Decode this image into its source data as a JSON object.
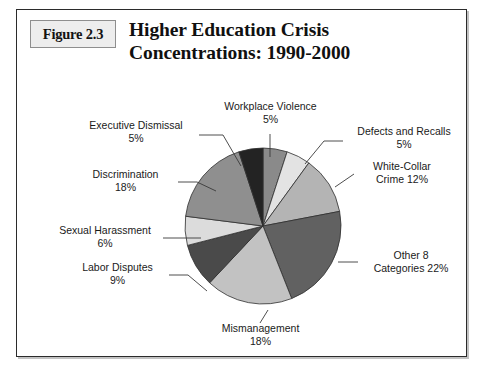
{
  "figure": {
    "label": "Figure 2.3",
    "title_line1": "Higher Education Crisis",
    "title_line2": "Concentrations: 1990-2000"
  },
  "chart_data": {
    "type": "pie",
    "title": "Higher Education Crisis Concentrations: 1990-2000",
    "xlabel": "",
    "ylabel": "",
    "units": "percent",
    "total": 100,
    "legend": "none",
    "grid": false,
    "start_angle_deg": 0,
    "direction": "clockwise",
    "categories": [
      "Workplace Violence",
      "Defects and Recalls",
      "White-Collar Crime",
      "Other 8 Categories",
      "Mismanagement",
      "Labor Disputes",
      "Sexual Harassment",
      "Discrimination",
      "Executive Dismissal"
    ],
    "values": [
      5,
      5,
      12,
      22,
      18,
      9,
      6,
      18,
      5
    ],
    "colors": [
      "#8a8a8a",
      "#e3e3e3",
      "#b4b4b4",
      "#616161",
      "#c2c2c2",
      "#4a4a4a",
      "#dcdcdc",
      "#8f8f8f",
      "#232323"
    ],
    "slices": [
      {
        "name": "Workplace Violence",
        "value": 5,
        "label_line1": "Workplace Violence",
        "label_line2": "5%"
      },
      {
        "name": "Defects and Recalls",
        "value": 5,
        "label_line1": "Defects and Recalls",
        "label_line2": "5%"
      },
      {
        "name": "White-Collar Crime",
        "value": 12,
        "label_line1": "White-Collar",
        "label_line2": "Crime 12%"
      },
      {
        "name": "Other 8 Categories",
        "value": 22,
        "label_line1": "Other 8",
        "label_line2": "Categories 22%"
      },
      {
        "name": "Mismanagement",
        "value": 18,
        "label_line1": "Mismanagement",
        "label_line2": "18%"
      },
      {
        "name": "Labor Disputes",
        "value": 9,
        "label_line1": "Labor Disputes",
        "label_line2": "9%"
      },
      {
        "name": "Sexual Harassment",
        "value": 6,
        "label_line1": "Sexual Harassment",
        "label_line2": "6%"
      },
      {
        "name": "Discrimination",
        "value": 18,
        "label_line1": "Discrimination",
        "label_line2": "18%"
      },
      {
        "name": "Executive Dismissal",
        "value": 5,
        "label_line1": "Executive Dismissal",
        "label_line2": "5%"
      }
    ]
  }
}
